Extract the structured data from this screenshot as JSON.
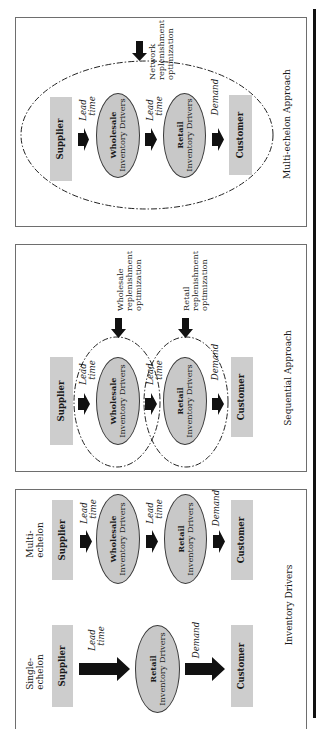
{
  "colors": {
    "box_fill": "#cdcdcd",
    "ellipse_fill": "#c8c8c8",
    "arrow": "#111111",
    "panel_border": "#6e6e6e",
    "dashed_line": "#222222"
  },
  "panels": [
    {
      "caption": "Multi-echelon Approach",
      "supplier": "Supplier",
      "wholesale_line1": "Wholesale",
      "wholesale_line2": "Inventory Drivers",
      "retail_line1": "Retail",
      "retail_line2": "Inventory Drivers",
      "customer": "Customer",
      "lead_time_1": [
        "Lead",
        "time"
      ],
      "lead_time_2": [
        "Lead",
        "time"
      ],
      "demand": "Demand",
      "optimization_label": [
        "Network",
        "replenishment",
        "optimization"
      ]
    },
    {
      "caption": "Sequential Approach",
      "supplier": "Supplier",
      "wholesale_line1": "Wholesale",
      "wholesale_line2": "Inventory Drivers",
      "retail_line1": "Retail",
      "retail_line2": "Inventory Drivers",
      "customer": "Customer",
      "lead_time_1": [
        "Lead",
        "time"
      ],
      "lead_time_2": [
        "Lead",
        "time"
      ],
      "demand": "Demand",
      "wholesale_optimization_label": [
        "Wholesale",
        "replenishment",
        "optimization"
      ],
      "retail_optimization_label": [
        "Retail",
        "replenishment",
        "optimization"
      ]
    },
    {
      "caption": "Inventory Drivers",
      "multi_echelon": {
        "label": [
          "Multi-",
          "echelon"
        ],
        "supplier": "Supplier",
        "wholesale_line1": "Wholesale",
        "wholesale_line2": "Inventory Drivers",
        "retail_line1": "Retail",
        "retail_line2": "Inventory Drivers",
        "customer": "Customer",
        "lead_time_1": [
          "Lead",
          "time"
        ],
        "lead_time_2": [
          "Lead",
          "time"
        ],
        "demand": "Demand"
      },
      "single_echelon": {
        "label": [
          "Single-",
          "echelon"
        ],
        "supplier": "Supplier",
        "retail_line1": "Retail",
        "retail_line2": "Inventory Drivers",
        "customer": "Customer",
        "lead_time": [
          "Lead",
          "time"
        ],
        "demand": "Demand"
      }
    }
  ]
}
